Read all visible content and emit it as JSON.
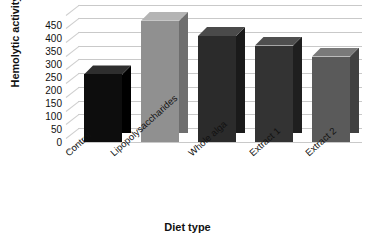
{
  "chart_data": {
    "type": "bar",
    "title": "",
    "xlabel": "Diet type",
    "ylabel": "Hemolytic activity (U/mL)",
    "categories": [
      "Control",
      "Lipopolysaccharides",
      "Whole alga",
      "Extract 1",
      "Extract 2"
    ],
    "values": [
      245,
      440,
      385,
      350,
      310
    ],
    "ylim": [
      0,
      450
    ],
    "yticks": [
      0,
      50,
      100,
      150,
      200,
      250,
      300,
      350,
      400,
      450
    ],
    "ytick_labels": [
      "0",
      "50",
      "100",
      "150",
      "200",
      "250",
      "300",
      "350",
      "400",
      "450"
    ],
    "grid": true,
    "legend": false,
    "style": "3d-column",
    "bar_colors": [
      "#0d0d0d",
      "#909090",
      "#2b2b2b",
      "#333333",
      "#5a5a5a"
    ],
    "bar_side_colors": [
      "#000000",
      "#6e6e6e",
      "#1a1a1a",
      "#1f1f1f",
      "#414141"
    ],
    "bar_top_colors": [
      "#2e2e2e",
      "#b4b4b4",
      "#4a4a4a",
      "#4f4f4f",
      "#7a7a7a"
    ],
    "gridline_color": "#c9c9c9",
    "background": "#ffffff"
  }
}
